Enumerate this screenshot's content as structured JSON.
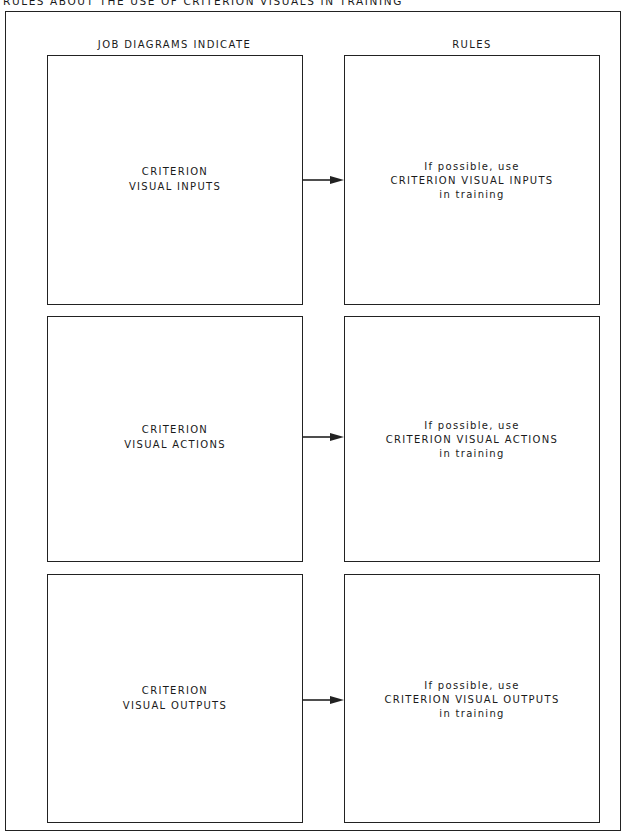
{
  "title": "RULES ABOUT THE USE OF CRITERION VISUALS IN TRAINING",
  "columns": {
    "left_header": "JOB DIAGRAMS INDICATE",
    "right_header": "RULES"
  },
  "rows": [
    {
      "left": {
        "line1": "CRITERION",
        "line2": "VISUAL INPUTS"
      },
      "right": {
        "line1": "If possible, use",
        "line2": "CRITERION VISUAL INPUTS",
        "line3": "in training"
      }
    },
    {
      "left": {
        "line1": "CRITERION",
        "line2": "VISUAL ACTIONS"
      },
      "right": {
        "line1": "If possible, use",
        "line2": "CRITERION VISUAL ACTIONS",
        "line3": "in training"
      }
    },
    {
      "left": {
        "line1": "CRITERION",
        "line2": "VISUAL OUTPUTS"
      },
      "right": {
        "line1": "If possible, use",
        "line2": "CRITERION VISUAL OUTPUTS",
        "line3": "in training"
      }
    }
  ],
  "colors": {
    "line": "#222222",
    "text": "#1a1a1a",
    "background": "#ffffff"
  }
}
